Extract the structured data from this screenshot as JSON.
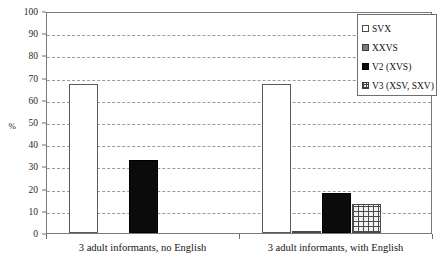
{
  "chart_data": {
    "type": "bar",
    "title": "",
    "subtitle": "",
    "xlabel": "",
    "ylabel": "%",
    "ylim": [
      0,
      100
    ],
    "ytick_step": 10,
    "yticks": [
      0,
      10,
      20,
      30,
      40,
      50,
      60,
      70,
      80,
      90,
      100
    ],
    "grid": "horizontal-dashed",
    "legend_position": "top-right",
    "categories": [
      "3 adult informants, no English",
      "3 adult informants, with English"
    ],
    "series": [
      {
        "name": "SVX",
        "values": [
          67,
          67
        ],
        "swatch": "series-svx",
        "color": "#ffffff"
      },
      {
        "name": "XXVS",
        "values": [
          0,
          1
        ],
        "swatch": "series-xxvs",
        "color": "#7b7b7b"
      },
      {
        "name": "V2 (XVS)",
        "values": [
          33,
          18
        ],
        "swatch": "series-v2",
        "color": "#0b0b0b"
      },
      {
        "name": "V3 (XSV, SXV)",
        "values": [
          0,
          13
        ],
        "swatch": "series-v3",
        "color": "#4a4a4a"
      }
    ]
  },
  "axis": {
    "y_title": "%",
    "y_tick_labels": [
      "0",
      "10",
      "20",
      "30",
      "40",
      "50",
      "60",
      "70",
      "80",
      "90",
      "100"
    ]
  },
  "legend": {
    "items": [
      {
        "label": "SVX"
      },
      {
        "label": "XXVS"
      },
      {
        "label": "V2 (XVS)"
      },
      {
        "label": "V3 (XSV, SXV)"
      }
    ]
  }
}
